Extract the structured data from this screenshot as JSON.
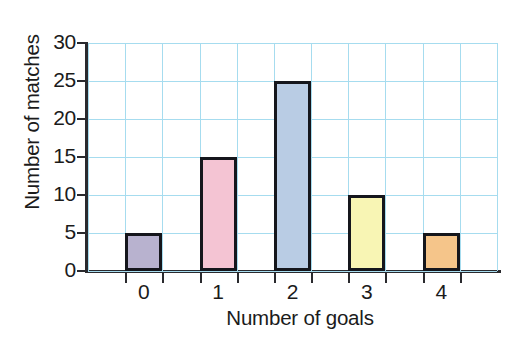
{
  "chart_data": {
    "type": "bar",
    "title": "",
    "categories": [
      "0",
      "1",
      "2",
      "3",
      "4"
    ],
    "values": [
      5,
      15,
      25,
      10,
      5
    ],
    "xlabel": "Number of goals",
    "ylabel": "Number of matches",
    "ylim": [
      0,
      30
    ],
    "yticks": [
      0,
      5,
      10,
      15,
      20,
      25,
      30
    ],
    "ytick_labels": [
      "0",
      "5",
      "10",
      "15",
      "20",
      "25",
      "30"
    ],
    "grid": true,
    "grid_color": "#a6dcef",
    "legend": null,
    "bar_colors": [
      "#b8b2cf",
      "#f4c4d3",
      "#b9cce4",
      "#f8f5b4",
      "#f5c58a"
    ],
    "bar_edge_color": "#15161c",
    "axis_color": "#2a2a2e",
    "background": "#ffffff",
    "series": [
      {
        "name": "matches",
        "values": [
          5,
          15,
          25,
          10,
          5
        ]
      }
    ]
  }
}
